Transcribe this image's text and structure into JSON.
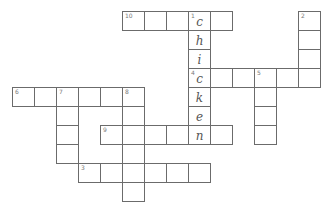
{
  "puzzle": {
    "type": "crossword",
    "cell_width": 22,
    "cell_height": 19,
    "origin_x": 12,
    "origin_y": 11,
    "colors": {
      "border": "#6b6b6b",
      "letter": "#555555",
      "number": "#7a7a7a",
      "background": "#ffffff"
    },
    "entries": [
      {
        "number": "10",
        "direction": "across",
        "row": 0,
        "col": 5,
        "length": 5,
        "letters": [
          "",
          "",
          "",
          "c",
          ""
        ]
      },
      {
        "number": "1",
        "direction": "down",
        "row": 0,
        "col": 8,
        "length": 7,
        "letters": [
          "c",
          "h",
          "i",
          "c",
          "k",
          "e",
          "n"
        ]
      },
      {
        "number": "2",
        "direction": "down",
        "row": 0,
        "col": 13,
        "length": 4,
        "letters": [
          "",
          "",
          "",
          ""
        ]
      },
      {
        "number": "4",
        "direction": "across",
        "row": 3,
        "col": 8,
        "length": 6,
        "letters": [
          "c",
          "",
          "",
          "",
          "",
          ""
        ]
      },
      {
        "number": "5",
        "direction": "down",
        "row": 3,
        "col": 11,
        "length": 4,
        "letters": [
          "",
          "",
          "",
          ""
        ]
      },
      {
        "number": "6",
        "direction": "across",
        "row": 4,
        "col": 0,
        "length": 6,
        "letters": [
          "",
          "",
          "",
          "",
          "",
          ""
        ]
      },
      {
        "number": "7",
        "direction": "down",
        "row": 4,
        "col": 2,
        "length": 4,
        "letters": [
          "",
          "",
          "",
          ""
        ]
      },
      {
        "number": "8",
        "direction": "down",
        "row": 4,
        "col": 5,
        "length": 6,
        "letters": [
          "",
          "",
          "",
          "",
          "",
          ""
        ]
      },
      {
        "number": "9",
        "direction": "across",
        "row": 6,
        "col": 4,
        "length": 6,
        "letters": [
          "",
          "",
          "",
          "",
          "n",
          ""
        ]
      },
      {
        "number": "3",
        "direction": "across",
        "row": 8,
        "col": 3,
        "length": 6,
        "letters": [
          "",
          "",
          "",
          "",
          "",
          ""
        ]
      }
    ]
  }
}
